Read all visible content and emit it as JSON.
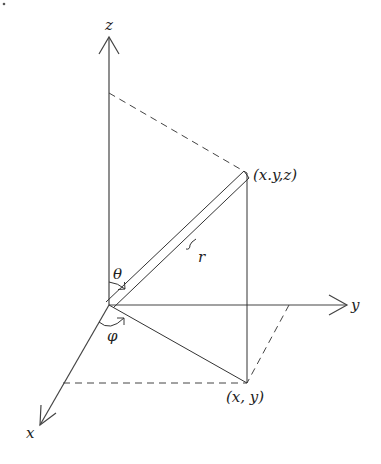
{
  "diagram": {
    "title": "",
    "type": "spherical-coordinates",
    "labels": {
      "z_axis": "z",
      "y_axis": "y",
      "x_axis": "x",
      "point_3d": "(x.y,z)",
      "point_2d": "(x, y)",
      "radius": "r",
      "theta": "θ",
      "phi": "φ"
    },
    "colors": {
      "line": "#444444",
      "background": "#ffffff"
    }
  }
}
